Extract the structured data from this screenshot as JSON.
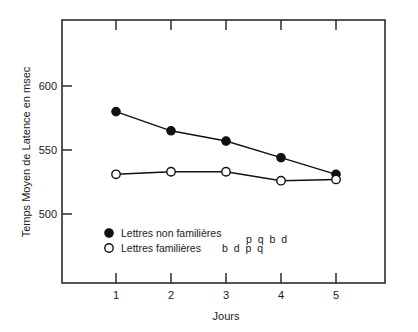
{
  "chart_data": {
    "type": "line",
    "title": "",
    "xlabel": "Jours",
    "ylabel": "Temps Moyen de Latence en msec",
    "categories": [
      1,
      2,
      3,
      4,
      5
    ],
    "x_tick_labels": [
      "1",
      "2",
      "3",
      "4",
      "5"
    ],
    "y_tick_labels": [
      "500",
      "550",
      "600"
    ],
    "y_ticks": [
      500,
      550,
      600
    ],
    "xlim": [
      0.2,
      5.7
    ],
    "ylim": [
      462,
      625
    ],
    "grid": false,
    "legend_position": "inside-lower-left",
    "series": [
      {
        "name": "Lettres non familières",
        "marker": "filled-circle",
        "legend_suffix": "ք Ʈƅ ɩ",
        "values": [
          580,
          565,
          557,
          544,
          531
        ]
      },
      {
        "name": "Lettres familières",
        "marker": "open-circle",
        "legend_suffix": "b d p q",
        "values": [
          531,
          533,
          533,
          526,
          527
        ]
      }
    ]
  },
  "legend": {
    "entries": [
      {
        "label": "Lettres non familières",
        "glyphs": "b d p q",
        "marker_name": "filled-circle-marker"
      },
      {
        "label": "Lettres familières",
        "glyphs": "b d p q",
        "marker_name": "open-circle-marker"
      }
    ]
  },
  "axes": {
    "y_title": "Temps Moyen de Latence en msec",
    "x_title": "Jours"
  }
}
